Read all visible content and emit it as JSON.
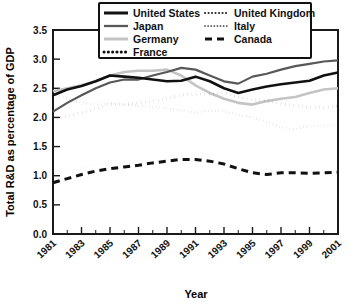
{
  "chart_data": {
    "type": "line",
    "title": "",
    "xlabel": "Year",
    "ylabel": "Total R&D as percentage of GDP",
    "xlim": [
      1981,
      2001
    ],
    "ylim": [
      0.0,
      3.5
    ],
    "grid": false,
    "legend_position": "top-center",
    "y_ticks": [
      "0.0",
      "0.5",
      "1.0",
      "1.5",
      "2.0",
      "2.5",
      "3.0",
      "3.5"
    ],
    "y_tick_values": [
      0.0,
      0.5,
      1.0,
      1.5,
      2.0,
      2.5,
      3.0,
      3.5
    ],
    "x_ticks": [
      "1981",
      "1983",
      "1985",
      "1987",
      "1989",
      "1991",
      "1993",
      "1995",
      "1997",
      "1999",
      "2001"
    ],
    "x_tick_values": [
      1981,
      1983,
      1985,
      1987,
      1989,
      1991,
      1993,
      1995,
      1997,
      1999,
      2001
    ],
    "x": [
      1981,
      1982,
      1983,
      1984,
      1985,
      1986,
      1987,
      1988,
      1989,
      1990,
      1991,
      1992,
      1993,
      1994,
      1995,
      1996,
      1997,
      1998,
      1999,
      2000,
      2001
    ],
    "series": [
      {
        "name": "United States",
        "color": "#111111",
        "width": 2.6,
        "dash": "none",
        "values": [
          2.38,
          2.48,
          2.54,
          2.62,
          2.72,
          2.7,
          2.68,
          2.65,
          2.62,
          2.63,
          2.7,
          2.62,
          2.5,
          2.42,
          2.48,
          2.53,
          2.57,
          2.6,
          2.63,
          2.72,
          2.77
        ]
      },
      {
        "name": "Japan",
        "color": "#585858",
        "width": 2.2,
        "dash": "none",
        "values": [
          2.1,
          2.25,
          2.38,
          2.5,
          2.6,
          2.65,
          2.65,
          2.72,
          2.78,
          2.85,
          2.82,
          2.72,
          2.62,
          2.58,
          2.7,
          2.75,
          2.82,
          2.88,
          2.92,
          2.96,
          2.98
        ]
      },
      {
        "name": "Germany",
        "color": "#c4c4c4",
        "width": 2.6,
        "dash": "none",
        "values": [
          2.45,
          2.5,
          2.55,
          2.62,
          2.72,
          2.78,
          2.8,
          2.8,
          2.82,
          2.72,
          2.55,
          2.42,
          2.32,
          2.25,
          2.22,
          2.28,
          2.32,
          2.35,
          2.42,
          2.48,
          2.5
        ]
      },
      {
        "name": "France",
        "color": "#111111",
        "width": 3.0,
        "dash": "dotted-bold",
        "values": [
          1.95,
          2.02,
          2.08,
          2.15,
          2.22,
          2.22,
          2.25,
          2.28,
          2.32,
          2.38,
          2.4,
          2.4,
          2.42,
          2.35,
          2.3,
          2.28,
          2.24,
          2.2,
          2.18,
          2.17,
          2.2
        ]
      },
      {
        "name": "United Kingdom",
        "color": "#222222",
        "width": 2.0,
        "dash": "dotted-fine",
        "values": [
          2.4,
          2.32,
          2.25,
          2.22,
          2.25,
          2.22,
          2.2,
          2.18,
          2.15,
          2.12,
          2.08,
          2.12,
          2.1,
          2.05,
          2.0,
          1.92,
          1.83,
          1.8,
          1.85,
          1.86,
          1.87
        ]
      },
      {
        "name": "Italy",
        "color": "#c0c0c0",
        "width": 1.8,
        "dash": "dotted-tiny",
        "values": [
          1.08,
          1.1,
          1.15,
          1.18,
          1.22,
          1.2,
          1.22,
          1.25,
          1.28,
          1.3,
          1.28,
          1.25,
          1.2,
          1.15,
          1.05,
          1.02,
          1.05,
          1.08,
          1.05,
          1.08,
          1.1
        ]
      },
      {
        "name": "Canada",
        "color": "#111111",
        "width": 3.0,
        "dash": "dashed",
        "values": [
          0.88,
          0.95,
          1.02,
          1.08,
          1.12,
          1.15,
          1.18,
          1.22,
          1.25,
          1.28,
          1.28,
          1.25,
          1.2,
          1.12,
          1.05,
          1.02,
          1.05,
          1.05,
          1.04,
          1.05,
          1.06
        ]
      }
    ],
    "legend_entries": [
      {
        "label": "United States",
        "style": "solid-thick-black"
      },
      {
        "label": "United Kingdom",
        "style": "dotted-fine"
      },
      {
        "label": "Japan",
        "style": "solid-gray"
      },
      {
        "label": "Italy",
        "style": "dotted-tiny"
      },
      {
        "label": "Germany",
        "style": "solid-lightgray"
      },
      {
        "label": "Canada",
        "style": "dashed"
      },
      {
        "label": "France",
        "style": "dotted-bold"
      }
    ]
  }
}
